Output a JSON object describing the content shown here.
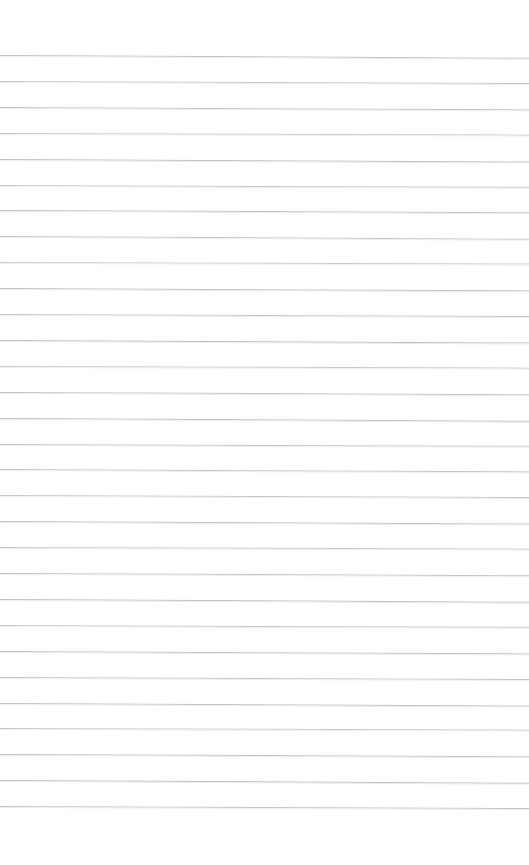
{
  "document": {
    "kind": "ruled-notebook-paper-scan",
    "title": "Blank ruled paper",
    "content_text": "",
    "page_width": 529,
    "page_height": 865,
    "background_color": "#ffffff",
    "rule_color": "#b3b7bb",
    "rule_secondary_color": "#e8eaec",
    "rule_thickness_px": 1,
    "rule_spacing_px": 25.9,
    "first_rule_y": 55,
    "last_rule_y": 813,
    "rule_count": 30,
    "top_margin_px": 55,
    "bottom_margin_px": 52,
    "left_margin_px": 0,
    "right_margin_px": 0,
    "has_vertical_margin_rule": false,
    "rules": [
      {
        "y": 55,
        "slant": 0.3,
        "opacity": 0.85
      },
      {
        "y": 80.9,
        "slant": 0.22,
        "opacity": 0.78
      },
      {
        "y": 106.8,
        "slant": 0.26,
        "opacity": 0.82
      },
      {
        "y": 132.7,
        "slant": 0.18,
        "opacity": 0.74
      },
      {
        "y": 158.6,
        "slant": 0.28,
        "opacity": 0.88
      },
      {
        "y": 184.5,
        "slant": 0.2,
        "opacity": 0.76
      },
      {
        "y": 210.4,
        "slant": 0.24,
        "opacity": 0.84
      },
      {
        "y": 236.3,
        "slant": 0.3,
        "opacity": 0.8
      },
      {
        "y": 262.2,
        "slant": 0.16,
        "opacity": 0.72
      },
      {
        "y": 288.1,
        "slant": 0.26,
        "opacity": 0.86
      },
      {
        "y": 314.0,
        "slant": 0.22,
        "opacity": 0.78
      },
      {
        "y": 339.9,
        "slant": 0.28,
        "opacity": 0.9
      },
      {
        "y": 365.8,
        "slant": 0.18,
        "opacity": 0.75
      },
      {
        "y": 391.7,
        "slant": 0.24,
        "opacity": 0.83
      },
      {
        "y": 417.6,
        "slant": 0.3,
        "opacity": 0.87
      },
      {
        "y": 443.5,
        "slant": 0.2,
        "opacity": 0.79
      },
      {
        "y": 469.4,
        "slant": 0.26,
        "opacity": 0.81
      },
      {
        "y": 495.3,
        "slant": 0.22,
        "opacity": 0.77
      },
      {
        "y": 521.2,
        "slant": 0.28,
        "opacity": 0.85
      },
      {
        "y": 547.1,
        "slant": 0.18,
        "opacity": 0.73
      },
      {
        "y": 573.0,
        "slant": 0.24,
        "opacity": 0.82
      },
      {
        "y": 598.9,
        "slant": 0.3,
        "opacity": 0.88
      },
      {
        "y": 624.8,
        "slant": 0.2,
        "opacity": 0.76
      },
      {
        "y": 650.7,
        "slant": 0.26,
        "opacity": 0.84
      },
      {
        "y": 676.6,
        "slant": 0.22,
        "opacity": 0.8
      },
      {
        "y": 702.5,
        "slant": 0.28,
        "opacity": 0.86
      },
      {
        "y": 728.4,
        "slant": 0.18,
        "opacity": 0.74
      },
      {
        "y": 754.3,
        "slant": 0.24,
        "opacity": 0.83
      },
      {
        "y": 780.2,
        "slant": 0.3,
        "opacity": 0.89
      },
      {
        "y": 806.1,
        "slant": 0.22,
        "opacity": 0.81
      }
    ]
  }
}
